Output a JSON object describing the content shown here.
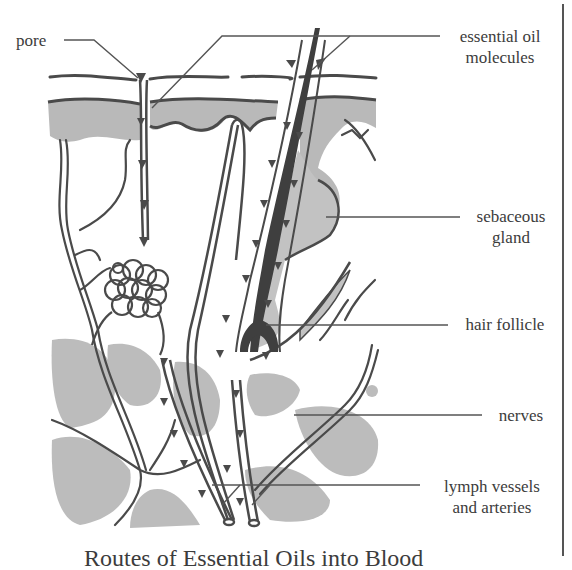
{
  "figure": {
    "caption": "Routes of Essential Oils into Blood",
    "colors": {
      "tissue": "#b9b9b9",
      "ink": "#4a4a4a",
      "hair": "#3f3f3f",
      "background": "#ffffff"
    }
  },
  "labels": {
    "pore": "pore",
    "essential_oil_line1": "essential oil",
    "essential_oil_line2": "molecules",
    "sebaceous_line1": "sebaceous",
    "sebaceous_line2": "gland",
    "hair_follicle": "hair follicle",
    "nerves": "nerves",
    "lymph_line1": "lymph vessels",
    "lymph_line2": "and arteries"
  }
}
